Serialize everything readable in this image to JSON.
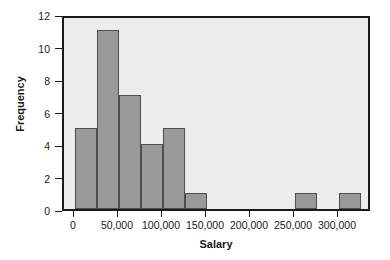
{
  "chart_data": {
    "type": "bar",
    "title": "",
    "xlabel": "Salary",
    "ylabel": "Frequency",
    "xlim": [
      -12500,
      337500
    ],
    "ylim": [
      0,
      12
    ],
    "grid": false,
    "legend": null,
    "bin_width": 25000,
    "xticks": [
      0,
      50000,
      100000,
      150000,
      200000,
      250000,
      300000
    ],
    "xtick_labels": [
      "0",
      "50,000",
      "100,000",
      "150,000",
      "200,000",
      "250,000",
      "300,000"
    ],
    "yticks": [
      0,
      2,
      4,
      6,
      8,
      10,
      12
    ],
    "ytick_labels": [
      "0",
      "2",
      "4",
      "6",
      "8",
      "10",
      "12"
    ],
    "bins": [
      {
        "left": 0,
        "right": 25000,
        "label": "0–25,000",
        "value": 5
      },
      {
        "left": 25000,
        "right": 50000,
        "label": "25,000–50,000",
        "value": 11
      },
      {
        "left": 50000,
        "right": 75000,
        "label": "50,000–75,000",
        "value": 7
      },
      {
        "left": 75000,
        "right": 100000,
        "label": "75,000–100,000",
        "value": 4
      },
      {
        "left": 100000,
        "right": 125000,
        "label": "100,000–125,000",
        "value": 5
      },
      {
        "left": 125000,
        "right": 150000,
        "label": "125,000–150,000",
        "value": 1
      },
      {
        "left": 250000,
        "right": 275000,
        "label": "250,000–275,000",
        "value": 1
      },
      {
        "left": 300000,
        "right": 325000,
        "label": "300,000–325,000",
        "value": 1
      }
    ],
    "colors": {
      "bar_fill": "#9a9a9a",
      "bar_edge": "#4f4f4f",
      "plot_background": "#ededed",
      "axis": "#1a1a1a",
      "figure_background": "#ffffff"
    }
  }
}
